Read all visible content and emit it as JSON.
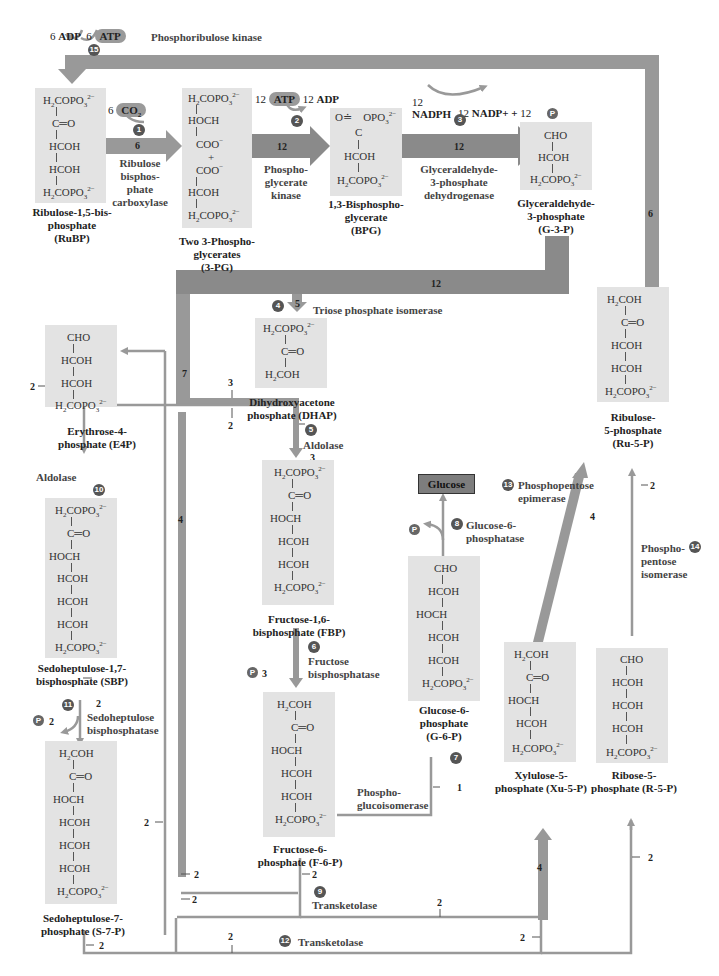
{
  "diagram": {
    "colors": {
      "box_bg": "#e3e3e3",
      "arrow": "#999999",
      "arrow_dark": "#8a8a8a",
      "step_circle": "#555555",
      "glucose_box": "#7d7d7d"
    },
    "cofactors": {
      "top_left": {
        "adp_count": "6",
        "adp": "ADP",
        "atp_count": "6",
        "atp": "ATP",
        "enzyme": "Phosphoribulose kinase",
        "step": "15"
      },
      "co2": {
        "count": "6",
        "label": "CO2",
        "step": "1"
      },
      "step2": {
        "atp_count": "12",
        "atp": "ATP",
        "adp_count": "12",
        "adp": "ADP",
        "step": "2"
      },
      "step3": {
        "nadph_count": "12",
        "nadph": "NADPH",
        "nadp_count": "12",
        "nadp": "NADP+ +",
        "pi_count": "12",
        "pi": "P",
        "step": "3"
      }
    },
    "molecules": [
      {
        "id": "rubp",
        "name": "Ribulose-1,5-bisphosphate",
        "abbr": "(RuBP)",
        "lines": [
          "H2COPO3 2-",
          "C=O",
          "HCOH",
          "HCOH",
          "H2COPO3 2-"
        ]
      },
      {
        "id": "3pg",
        "name": "Two 3-Phosphoglycerates",
        "abbr": "(3-PG)",
        "lines": [
          "H2COPO3 2-",
          "HOCH",
          "COO-",
          "+",
          "COO-",
          "HCOH",
          "H2COPO3 2-"
        ]
      },
      {
        "id": "bpg",
        "name": "1,3-Bisphosphoglycerate",
        "abbr": "(BPG)",
        "lines": [
          "O=C-OPO3 2-",
          "HCOH",
          "H2COPO3 2-"
        ]
      },
      {
        "id": "g3p",
        "name": "Glyceraldehyde-3-phosphate",
        "abbr": "(G-3-P)",
        "lines": [
          "CHO",
          "HCOH",
          "H2COPO3 2-"
        ]
      },
      {
        "id": "dhap",
        "name": "Dihydroxyacetone phosphate",
        "abbr": "(DHAP)",
        "lines": [
          "H2COPO3 2-",
          "C=O",
          "H2COH"
        ]
      },
      {
        "id": "e4p",
        "name": "Erythrose-4-phosphate",
        "abbr": "(E4P)",
        "lines": [
          "CHO",
          "HCOH",
          "HCOH",
          "H2COPO3 2-"
        ]
      },
      {
        "id": "fbp",
        "name": "Fructose-1,6-bisphosphate",
        "abbr": "(FBP)",
        "lines": [
          "H2COPO3 2-",
          "C=O",
          "HOCH",
          "HCOH",
          "HCOH",
          "H2COPO3 2-"
        ]
      },
      {
        "id": "ru5p",
        "name": "Ribulose-5-phosphate",
        "abbr": "(Ru-5-P)",
        "lines": [
          "H2COH",
          "C=O",
          "HCOH",
          "HCOH",
          "H2COPO3 2-"
        ]
      },
      {
        "id": "sbp",
        "name": "Sedoheptulose-1,7-bisphosphate",
        "abbr": "(SBP)",
        "lines": [
          "H2COPO3 2-",
          "C=O",
          "HOCH",
          "HCOH",
          "HCOH",
          "HCOH",
          "H2COPO3 2-"
        ]
      },
      {
        "id": "g6p",
        "name": "Glucose-6-phosphate",
        "abbr": "(G-6-P)",
        "lines": [
          "CHO",
          "HCOH",
          "HOCH",
          "HCOH",
          "HCOH",
          "H2COPO3 2-"
        ]
      },
      {
        "id": "f6p",
        "name": "Fructose-6-phosphate",
        "abbr": "(F-6-P)",
        "lines": [
          "H2COH",
          "C=O",
          "HOCH",
          "HCOH",
          "HCOH",
          "H2COPO3 2-"
        ]
      },
      {
        "id": "xu5p",
        "name": "Xylulose-5-phosphate",
        "abbr": "(Xu-5-P)",
        "lines": [
          "H2COH",
          "C=O",
          "HOCH",
          "HCOH",
          "H2COPO3 2-"
        ]
      },
      {
        "id": "r5p",
        "name": "Ribose-5-phosphate",
        "abbr": "(R-5-P)",
        "lines": [
          "CHO",
          "HCOH",
          "HCOH",
          "HCOH",
          "H2COPO3 2-"
        ]
      },
      {
        "id": "s7p",
        "name": "Sedoheptulose-7-phosphate",
        "abbr": "(S-7-P)",
        "lines": [
          "H2COH",
          "C=O",
          "HOCH",
          "HCOH",
          "HCOH",
          "HCOH",
          "H2COPO3 2-"
        ]
      }
    ],
    "labels": {
      "rubp": [
        "Ribulose-1,5-bis-",
        "phosphate",
        "(RuBP)"
      ],
      "3pg": [
        "Two 3-Phospho-",
        "glycerates",
        "(3-PG)"
      ],
      "bpg": [
        "1,3-Bisphospho-",
        "glycerate",
        "(BPG)"
      ],
      "g3p": [
        "Glyceraldehyde-",
        "3-phosphate",
        "(G-3-P)"
      ],
      "dhap": [
        "Dihydroxyacetone",
        "phosphate (DHAP)"
      ],
      "e4p": [
        "Erythrose-4-",
        "phosphate (E4P)"
      ],
      "fbp": [
        "Fructose-1,6-",
        "bisphosphate (FBP)"
      ],
      "ru5p": [
        "Ribulose-",
        "5-phosphate",
        "(Ru-5-P)"
      ],
      "sbp": [
        "Sedoheptulose-1,7-",
        "bisphosphate (SBP)"
      ],
      "g6p": [
        "Glucose-6-",
        "phosphate",
        "(G-6-P)"
      ],
      "f6p": [
        "Fructose-6-",
        "phosphate (F-6-P)"
      ],
      "xu5p": [
        "Xylulose-5-",
        "phosphate (Xu-5-P)"
      ],
      "r5p": [
        "Ribose-5-",
        "phosphate (R-5-P)"
      ],
      "s7p": [
        "Sedoheptulose-7-",
        "phosphate (S-7-P)"
      ],
      "glucose": "Glucose"
    },
    "enzymes": {
      "e1": [
        "Ribulose",
        "bisphos-",
        "phate",
        "carboxylase"
      ],
      "e2": [
        "Phospho-",
        "glycerate",
        "kinase"
      ],
      "e3": [
        "Glyceraldehyde-",
        "3-phosphate",
        "dehydrogenase"
      ],
      "e4": "Triose phosphate isomerase",
      "e5": "Aldolase",
      "e6": [
        "Fructose",
        "bisphosphatase"
      ],
      "e7": [
        "Phospho-",
        "glucoisomerase"
      ],
      "e8": [
        "Glucose-6-",
        "phosphatase"
      ],
      "e9": "Transketolase",
      "e10": "Aldolase",
      "e11": [
        "Sedoheptulose",
        "bisphosphatase"
      ],
      "e12": "Transketolase",
      "e13": [
        "Phosphopentose",
        "epimerase"
      ],
      "e14": [
        "Phospho-",
        "pentose",
        "isomerase"
      ],
      "e15": "Phosphoribulose kinase"
    },
    "steps": [
      "1",
      "2",
      "3",
      "4",
      "5",
      "6",
      "7",
      "8",
      "9",
      "10",
      "11",
      "12",
      "13",
      "14",
      "15"
    ],
    "stoichiometry": {
      "rubp_to_3pg": "6",
      "3pg_to_bpg": "12",
      "bpg_to_g3p": "12",
      "g3p_down": "12",
      "to_dhap": "5",
      "left_branch": "7",
      "dhap_branch": "3",
      "e4p_branch": "2",
      "aldolase_in": "3",
      "lower_left": "4",
      "ru5p_return": "6",
      "fbp_pi": "3",
      "g6p_in": "1",
      "sbp_in": "2",
      "sbp_pi": "2",
      "s7p_out": "2",
      "f6p_out": "2",
      "t1": "2",
      "t2": "2",
      "t3": "2",
      "t4": "2",
      "t5": "2",
      "xu5p_in": "4",
      "xu5p_to_ru5p": "4",
      "r5p_in": "2",
      "r5p_to_ru5p": "2",
      "bottom_xu": "2",
      "left_line": "2"
    },
    "pi_label": "P"
  }
}
